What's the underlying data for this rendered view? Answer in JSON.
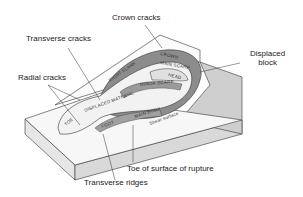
{
  "diagram": {
    "callouts": {
      "crown_cracks": "Crown cracks",
      "transverse_cracks": "Transverse cracks",
      "radial_cracks": "Radial cracks",
      "displaced_block_line1": "Displaced",
      "displaced_block_line2": "block",
      "toe_of_surface": "Toe of surface of rupture",
      "transverse_ridges": "Transverse ridges"
    },
    "inner_labels": {
      "crown": "CROWN",
      "main_scarp": "MAIN SCARP",
      "head": "HEAD",
      "minor_scarp": "MINOR SCARP",
      "right_flank": "RIGHT FLANK",
      "displaced_material": "DISPLACED MATERIAL",
      "main_body": "MAIN BODY",
      "foot": "FOOT",
      "toe": "TOE",
      "surface_of_rupture": "SURFACE OF RUPTURE",
      "shear_surface": "Shear surface"
    },
    "colors": {
      "background": "#ffffff",
      "line": "#333333",
      "block_side": "#d9d9d9",
      "scarp": "#8c8c8c",
      "displaced": "#f2f2f2"
    }
  }
}
